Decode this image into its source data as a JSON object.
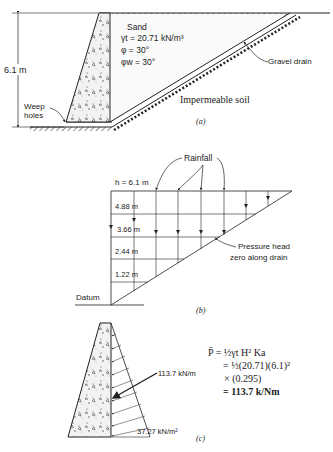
{
  "panel_a": {
    "caption": "(a)",
    "height_label": "6.1 m",
    "material_label": "Sand",
    "gamma_label": "γt = 20.71 kN/m³",
    "phi_label": "φ = 30°",
    "phi_w_label": "φw = 30°",
    "drain_label": "Gravel drain",
    "soil_label": "Impermeable soil",
    "weep_label_1": "Weep",
    "weep_label_2": "holes"
  },
  "panel_b": {
    "caption": "(b)",
    "top_label": "h = 6.1 m",
    "rain_label": "Rainfall",
    "head_levels": [
      "4.88 m",
      "3.66 m",
      "2.44 m",
      "1.22 m"
    ],
    "datum_label": "Datum",
    "pressure_label_1": "Pressure head",
    "pressure_label_2": "zero along drain"
  },
  "panel_c": {
    "caption": "(c)",
    "resultant_label": "113.7 kN/m",
    "base_pressure_label": "37.27 kN/m²",
    "equation": {
      "line1": "P̄ = ½γt H² Ka",
      "line2": "= ½(20.71)(6.1)²",
      "line3": "× (0.295)",
      "line4": "= 113.7 k/Nm"
    }
  }
}
